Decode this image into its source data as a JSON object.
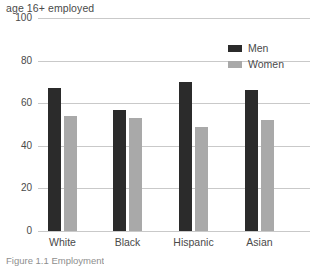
{
  "chart_data": {
    "type": "bar",
    "title": "age 16+ employed",
    "subtitle": "",
    "xlabel": "",
    "ylabel": "",
    "ylim": [
      0,
      100
    ],
    "yticks": [
      0,
      20,
      40,
      60,
      80,
      100
    ],
    "ytick_labels": [
      "0",
      "20",
      "40",
      "60",
      "80",
      "100"
    ],
    "grid": true,
    "legend_position": "top-right",
    "categories": [
      "White",
      "Black",
      "Hispanic",
      "Asian"
    ],
    "series": [
      {
        "name": "Men",
        "color": "#2b2b2b",
        "values": [
          67,
          57,
          70,
          66
        ]
      },
      {
        "name": "Women",
        "color": "#a9a9a9",
        "values": [
          54,
          53,
          49,
          52
        ]
      }
    ]
  },
  "caption": {
    "text": "Figure 1.1 Employment"
  },
  "colors": {
    "men": "#2b2b2b",
    "women": "#a9a9a9",
    "gridline": "#c9c9c9",
    "text": "#4a4a4a",
    "background": "#ffffff"
  }
}
